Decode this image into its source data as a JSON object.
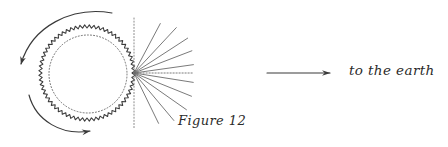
{
  "figure": {
    "caption": "Figure 12",
    "earth_direction_label": "to the earth",
    "background_color": "#ffffff",
    "ink_color": "#3a3a3a",
    "light_ink_color": "#7d7d7d"
  },
  "chart_data": {
    "type": "diagram",
    "title": "Figure 12",
    "annotations": [
      {
        "name": "caption",
        "text": "Figure 12",
        "x": 178,
        "y": 120
      },
      {
        "name": "earth-direction",
        "text": "to the earth",
        "x": 349,
        "y": 73
      }
    ],
    "elements": [
      {
        "name": "sawtooth-circle",
        "kind": "circle-sawtooth",
        "cx": 87,
        "cy": 73,
        "r": 45,
        "teeth": 64,
        "tooth_depth": 3.2,
        "stroke": "#3a3a3a"
      },
      {
        "name": "dotted-inner-circle",
        "kind": "circle-dotted",
        "cx": 88,
        "cy": 74,
        "r": 39,
        "stroke": "#6e6e6e",
        "dash": "1 2"
      },
      {
        "name": "vertical-axis-line",
        "kind": "line-dotted",
        "x1": 134,
        "y1": 18,
        "x2": 134,
        "y2": 129,
        "stroke": "#8a8a8a"
      },
      {
        "name": "ray-fan",
        "kind": "rays",
        "origin_x": 134,
        "origin_y": 73,
        "count": 10,
        "angles_deg": [
          -62,
          -47,
          -33,
          -21,
          -8,
          0,
          9,
          22,
          35,
          50,
          64
        ],
        "lengths": [
          56,
          62,
          64,
          62,
          60,
          59,
          60,
          62,
          64,
          62,
          56
        ],
        "stroke": "#6b6b6b"
      },
      {
        "name": "rotation-arrow-upper",
        "kind": "arc-arrow",
        "from_x": 112,
        "from_y": 13,
        "to_x": 22,
        "to_y": 82,
        "direction": "counterclockwise-down-left",
        "stroke": "#3a3a3a"
      },
      {
        "name": "rotation-arrow-lower",
        "kind": "arc-arrow",
        "from_x": 30,
        "from_y": 96,
        "to_x": 100,
        "to_y": 131,
        "direction": "clockwise-down-right",
        "stroke": "#3a3a3a"
      },
      {
        "name": "earth-direction-arrow",
        "kind": "straight-arrow",
        "x1": 267,
        "y1": 73,
        "x2": 338,
        "y2": 73,
        "stroke": "#3a3a3a"
      }
    ]
  }
}
